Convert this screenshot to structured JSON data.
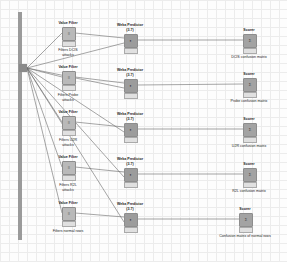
{
  "workflow": {
    "input": {
      "name": "metanode-input"
    },
    "filters": [
      {
        "title": "Value Filter",
        "caption": "Filters DCIS attacks",
        "caption_lines": [
          "Filters DCIS",
          "attacks"
        ]
      },
      {
        "title": "Value Filter",
        "caption": "Filters Probe attacks",
        "caption_lines": [
          "Filters Probe",
          "attacks"
        ]
      },
      {
        "title": "Value Filter",
        "caption": "Filters U2R attacks",
        "caption_lines": [
          "Filters U2R",
          "attacks"
        ]
      },
      {
        "title": "Value Filter",
        "caption": "Filters R2L attacks",
        "caption_lines": [
          "Filters R2L",
          "attacks"
        ]
      },
      {
        "title": "Value Filter",
        "caption": "Filters normal rows",
        "caption_lines": [
          "Filters normal rows"
        ]
      }
    ],
    "predictors": [
      {
        "title": "Weka Predictor",
        "version": "(3.7)"
      },
      {
        "title": "Weka Predictor",
        "version": "(3.7)"
      },
      {
        "title": "Weka Predictor",
        "version": "(3.7)"
      },
      {
        "title": "Weka Predictor",
        "version": "(3.7)"
      },
      {
        "title": "Weka Predictor",
        "version": "(3.7)"
      }
    ],
    "scorers": [
      {
        "title": "Scorer",
        "caption": "DCIS confusion matrix"
      },
      {
        "title": "Scorer",
        "caption": "Probe confusion matrix"
      },
      {
        "title": "Scorer",
        "caption": "U2R confusion matrix"
      },
      {
        "title": "Scorer",
        "caption": "R2L confusion matrix"
      },
      {
        "title": "Scorer",
        "caption": "Confusion matrix of normal rows"
      }
    ],
    "node_icons": {
      "filter": "filter-icon",
      "predictor": "predictor-icon",
      "scorer": "scorer-icon"
    }
  }
}
